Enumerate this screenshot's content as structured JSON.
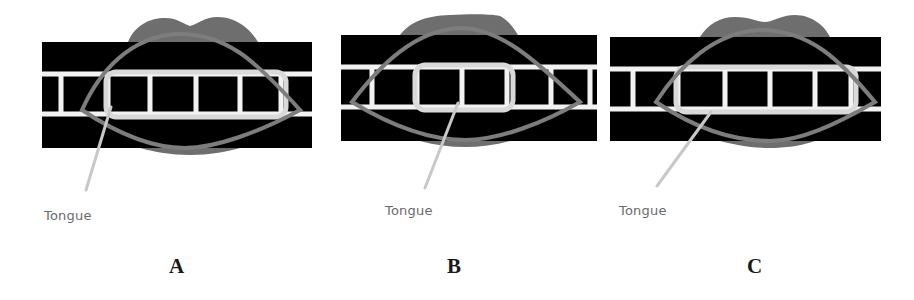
{
  "figure": {
    "width": 914,
    "height": 300,
    "colors": {
      "background": "#ffffff",
      "band": "#050505",
      "gum_line": "#f2f2f2",
      "lip": "#6e6e6e",
      "lip_outline": "#7d7d7d",
      "teeth_outline": "#d9d9d9",
      "pointer": "#c8c8c8",
      "callout_text": "#6a6a6a",
      "label_text": "#1a1a1a"
    },
    "panels": [
      {
        "id": "A",
        "label": "A",
        "callout": "Tongue",
        "band": {
          "x": 42,
          "y": 42,
          "w": 270,
          "h": 106
        },
        "upper_line_y": 74,
        "lower_line_y": 114,
        "line_thickness": 5,
        "dividers_x": [
          61,
          108,
          150,
          196,
          240,
          281
        ],
        "teeth_box": {
          "x": 106,
          "y": 72,
          "w": 180,
          "h": 45
        },
        "upper_lip": "M128,42 C135,25 150,18 165,18 C178,18 185,25 190,26 C196,25 204,17 218,17 C235,17 250,28 258,42 Z",
        "lower_lip": "M140,148 C155,152 170,155 190,155 C210,155 225,152 240,148 Z",
        "lip_curve": "M82,110 C100,70 130,38 175,34 C225,32 255,60 300,110 C260,132 215,148 185,148 C150,148 115,132 82,110 Z",
        "pointer": {
          "x1": 111,
          "y1": 107,
          "x2": 86,
          "y2": 190
        },
        "callout_pos": {
          "x": 44,
          "y": 208
        },
        "label_pos": {
          "x": 169,
          "y": 254
        }
      },
      {
        "id": "B",
        "label": "B",
        "callout": "Tongue",
        "band": {
          "x": 341,
          "y": 35,
          "w": 256,
          "h": 106
        },
        "upper_line_y": 67,
        "lower_line_y": 107,
        "line_thickness": 5,
        "dividers_x": [
          372,
          417,
          462,
          507,
          551,
          590
        ],
        "teeth_box": {
          "x": 415,
          "y": 65,
          "w": 98,
          "h": 45
        },
        "upper_lip": "M400,35 C410,22 425,16 450,15 C470,14 490,14 500,16 C508,20 514,28 518,35 Z",
        "lower_lip": "M420,141 C435,145 450,147 465,147 C480,147 495,145 510,141 Z",
        "lip_curve": "M352,102 C380,65 415,30 460,28 C500,28 535,60 580,102 C545,122 500,140 465,140 C425,140 385,122 352,102 Z",
        "pointer": {
          "x1": 458,
          "y1": 103,
          "x2": 425,
          "y2": 188
        },
        "callout_pos": {
          "x": 385,
          "y": 203
        },
        "label_pos": {
          "x": 447,
          "y": 254
        }
      },
      {
        "id": "C",
        "label": "C",
        "callout": "Tongue",
        "band": {
          "x": 610,
          "y": 37,
          "w": 271,
          "h": 104
        },
        "upper_line_y": 69,
        "lower_line_y": 109,
        "line_thickness": 5,
        "dividers_x": [
          633,
          678,
          725,
          770,
          815,
          851
        ],
        "teeth_box": {
          "x": 676,
          "y": 67,
          "w": 180,
          "h": 45
        },
        "upper_lip": "M700,37 C708,24 720,17 735,17 C750,17 758,22 765,22 C772,22 782,15 795,15 C812,15 825,26 830,37 Z",
        "lower_lip": "M720,141 C740,146 755,148 770,148 C785,148 800,146 815,141 Z",
        "lip_curve": "M656,102 C680,65 715,32 760,30 C810,30 840,60 875,102 C835,125 800,141 770,141 C730,141 690,125 656,102 Z",
        "pointer": {
          "x1": 711,
          "y1": 112,
          "x2": 657,
          "y2": 186
        },
        "callout_pos": {
          "x": 619,
          "y": 203
        },
        "label_pos": {
          "x": 747,
          "y": 254
        }
      }
    ]
  }
}
